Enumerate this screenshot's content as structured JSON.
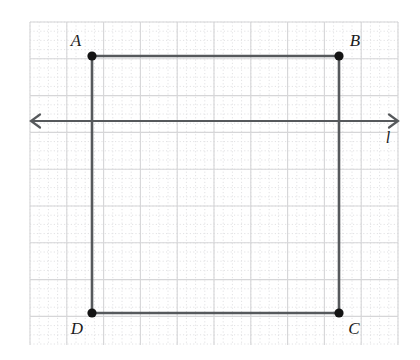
{
  "figure": {
    "background_color": "#ffffff",
    "width": 420,
    "height": 360
  },
  "grid": {
    "x0": 30,
    "y0": 22,
    "x1": 398,
    "y1": 345,
    "minor_step": 9.2,
    "major_step": 36.8,
    "minor_color": "#e2e2e4",
    "major_color": "#d6d6d8",
    "minor_style": "dotted",
    "major_style": "solid"
  },
  "shape": {
    "name": "square",
    "stroke_color": "#56595c",
    "stroke_width": 2.6,
    "vertex_dot_color": "#141414",
    "vertex_dot_radius": 4.6,
    "vertices": [
      {
        "id": "A",
        "label": "A",
        "x": 92,
        "y": 56,
        "label_x": 76,
        "label_y": 42
      },
      {
        "id": "B",
        "label": "B",
        "x": 339,
        "y": 56,
        "label_x": 355,
        "label_y": 42
      },
      {
        "id": "C",
        "label": "C",
        "x": 339,
        "y": 313,
        "label_x": 354,
        "label_y": 330
      },
      {
        "id": "D",
        "label": "D",
        "x": 92,
        "y": 313,
        "label_x": 77,
        "label_y": 330
      }
    ],
    "edges": [
      {
        "id": "AB",
        "from": "A",
        "to": "B"
      },
      {
        "id": "BC",
        "from": "B",
        "to": "C"
      },
      {
        "id": "CD",
        "from": "C",
        "to": "D"
      },
      {
        "id": "DA",
        "from": "D",
        "to": "A"
      }
    ]
  },
  "line": {
    "id": "l",
    "label": "l",
    "y": 121,
    "x_start": 31,
    "x_end": 398,
    "stroke_color": "#56595c",
    "stroke_width": 2.2,
    "arrowheads": "both",
    "arrowhead_style": "open-v",
    "label_x": 388,
    "label_y": 139
  }
}
